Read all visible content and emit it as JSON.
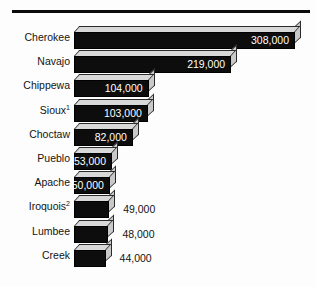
{
  "chart_data": {
    "type": "bar",
    "orientation": "horizontal",
    "title": "",
    "subtitle": "",
    "xlabel": "",
    "ylabel": "",
    "grid": false,
    "legend": null,
    "axis_visible": false,
    "value_format": "comma-separated integers",
    "xlim": [
      0,
      308000
    ],
    "categories": [
      "Cherokee",
      "Navajo",
      "Chippewa",
      "Sioux",
      "Choctaw",
      "Pueblo",
      "Apache",
      "Iroquois",
      "Lumbee",
      "Creek"
    ],
    "values": [
      308000,
      219000,
      104000,
      103000,
      82000,
      53000,
      50000,
      49000,
      48000,
      44000
    ],
    "value_labels": [
      "308,000",
      "219,000",
      "104,000",
      "103,000",
      "82,000",
      "53,000",
      "50,000",
      "49,000",
      "48,000",
      "44,000"
    ],
    "footnote_markers": {
      "Sioux": "1",
      "Iroquois": "2"
    },
    "style": {
      "bar_front_color": "#0d0d0d",
      "bar_top_color": "#d8d8d8",
      "bar_side_color": "#c9c9c9",
      "inside_label_color": "#ffffff",
      "outside_label_color": "#141414",
      "rule_color": "#0b0b0b",
      "background": "#ffffff"
    }
  },
  "rows": [
    {
      "label": "Cherokee",
      "sup": "",
      "value_label": "308,000",
      "value": 308000,
      "label_inside": true
    },
    {
      "label": "Navajo",
      "sup": "",
      "value_label": "219,000",
      "value": 219000,
      "label_inside": true
    },
    {
      "label": "Chippewa",
      "sup": "",
      "value_label": "104,000",
      "value": 104000,
      "label_inside": true
    },
    {
      "label": "Sioux",
      "sup": "1",
      "value_label": "103,000",
      "value": 103000,
      "label_inside": true
    },
    {
      "label": "Choctaw",
      "sup": "",
      "value_label": "82,000",
      "value": 82000,
      "label_inside": true
    },
    {
      "label": "Pueblo",
      "sup": "",
      "value_label": "53,000",
      "value": 53000,
      "label_inside": true
    },
    {
      "label": "Apache",
      "sup": "",
      "value_label": "50,000",
      "value": 50000,
      "label_inside": true
    },
    {
      "label": "Iroquois",
      "sup": "2",
      "value_label": "49,000",
      "value": 49000,
      "label_inside": false
    },
    {
      "label": "Lumbee",
      "sup": "",
      "value_label": "48,000",
      "value": 48000,
      "label_inside": false
    },
    {
      "label": "Creek",
      "sup": "",
      "value_label": "44,000",
      "value": 44000,
      "label_inside": false
    }
  ]
}
